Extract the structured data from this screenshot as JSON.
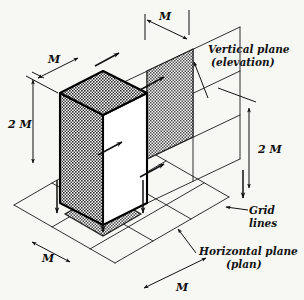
{
  "figure": {
    "background_color": "#f7f7f4",
    "line_color": "#1a1a1a",
    "shade_color": "#8d8d8d",
    "box_outline_color": "#000000"
  },
  "dimensions": {
    "top_m": "M",
    "upper_left_m": "M",
    "left_2m": "2 M",
    "right_2m": "2 M",
    "bottom_left_m": "M",
    "bottom_right_m": "M"
  },
  "annotations": {
    "vertical_plane_line1": "Vertical plane",
    "vertical_plane_line2": "(elevation)",
    "grid_lines_line1": "Grid",
    "grid_lines_line2": "lines",
    "horizontal_plane_line1": "Horizontal plane",
    "horizontal_plane_line2": "(plan)"
  },
  "geometry": {
    "module_note": "Box measures M by M in plan and 2M in height",
    "grid_divisions": 3
  }
}
